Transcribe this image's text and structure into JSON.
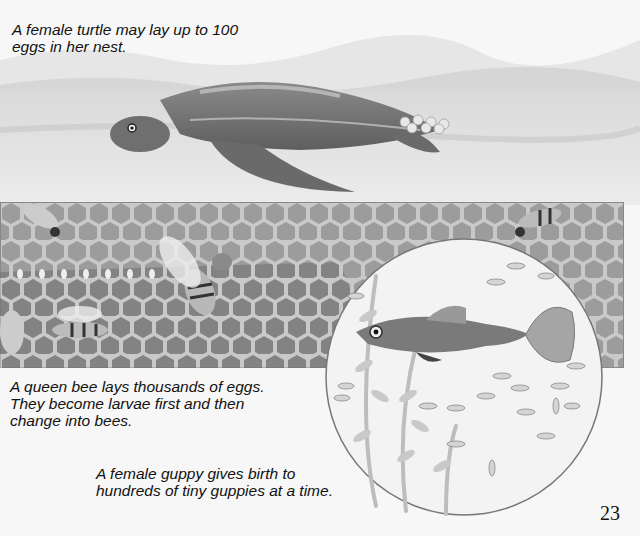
{
  "page": {
    "number": "23",
    "captions": {
      "turtle": [
        "A female turtle may lay up to 100",
        "eggs in her nest."
      ],
      "bee": [
        "A queen bee lays thousands of eggs.",
        "They become larvae first and then",
        "change into bees."
      ],
      "guppy": [
        "A female guppy gives birth to",
        "hundreds of tiny guppies at a time."
      ]
    },
    "illustrations": {
      "turtle": "turtle-laying-eggs-illustration",
      "bees": "honeycomb-with-bees-illustration",
      "guppy": "guppy-with-fry-illustration"
    }
  }
}
